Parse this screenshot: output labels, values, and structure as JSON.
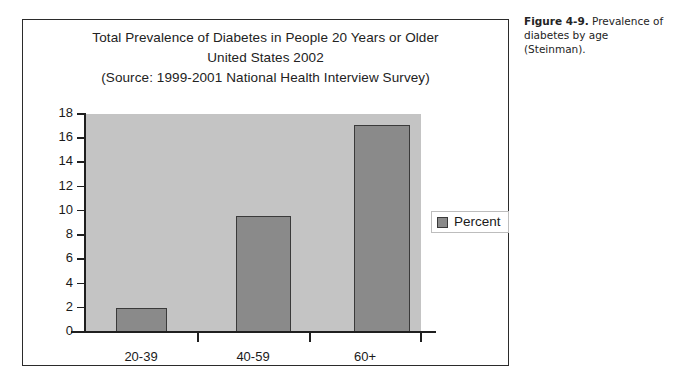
{
  "caption": {
    "figure_label": "Figure 4-9.",
    "text": " Prevalence of diabetes by age (Steinman)."
  },
  "legend": {
    "label": "Percent",
    "swatch_color": "#8a8a8a",
    "position": "right"
  },
  "colors": {
    "plot_background": "#c4c4c4",
    "bar_fill": "#8a8a8a",
    "bar_outline": "#3a3a3a",
    "axis": "#1f1f1f",
    "page_background": "#ffffff",
    "frame_border": "#2b2b2b"
  },
  "chart_data": {
    "type": "bar",
    "title": "Total Prevalence of Diabetes in People 20 Years or Older\nUnited States 2002\n(Source: 1999-2001 National Health Interview Survey)",
    "title_lines": [
      "Total Prevalence of Diabetes in People 20 Years or Older",
      "United States 2002",
      "(Source: 1999-2001 National Health Interview Survey)"
    ],
    "categories": [
      "20-39",
      "40-59",
      "60+"
    ],
    "values": [
      2.0,
      9.6,
      17.1
    ],
    "series": [
      {
        "name": "Percent",
        "values": [
          2.0,
          9.6,
          17.1
        ]
      }
    ],
    "xlabel": "",
    "ylabel": "",
    "ylim": [
      0,
      18
    ],
    "yticks": [
      0,
      2,
      4,
      6,
      8,
      10,
      12,
      14,
      16,
      18
    ],
    "ytick_labels": [
      "0",
      "2",
      "4",
      "6",
      "8",
      "10",
      "12",
      "14",
      "16",
      "18"
    ],
    "grid": false,
    "legend_position": "right"
  }
}
